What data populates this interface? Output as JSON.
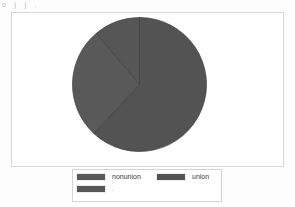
{
  "page": {
    "scan_header_text": "o  j  j  .",
    "background_color": "#fdfdfd"
  },
  "chart_frame": {
    "border_color": "#d8d8da",
    "background_color": "#ffffff"
  },
  "legend": {
    "border_color": "#d4d4d6",
    "background_color": "#ffffff",
    "items": [
      {
        "label": "nonunion",
        "color": "#595959"
      },
      {
        "label": "union",
        "color": "#535353"
      },
      {
        "label": ".",
        "color": "#565656"
      }
    ]
  },
  "chart_data": {
    "type": "pie",
    "title": "",
    "subtitle": "",
    "xlabel": "",
    "ylabel": "",
    "grid": false,
    "legend_position": "bottom",
    "categories": [
      "union",
      "nonunion",
      "."
    ],
    "values": [
      62,
      27,
      11
    ],
    "colors": [
      "#535353",
      "#595959",
      "#565656"
    ],
    "slices": [
      {
        "name": "union",
        "value": 62,
        "color": "#535353",
        "start_angle_deg": 0,
        "end_angle_deg": 223,
        "path": "M 68.5 68.5 L 68.5 1.5 A 67 67 0 1 1 22.8 120.2 Z"
      },
      {
        "name": "nonunion",
        "value": 27,
        "color": "#595959",
        "start_angle_deg": 223,
        "end_angle_deg": 320,
        "path": "M 68.5 68.5 L 22.8 120.2 A 67 67 0 0 1 25.6 25.1 Z"
      },
      {
        "name": ".",
        "value": 11,
        "color": "#565656",
        "start_angle_deg": 320,
        "end_angle_deg": 360,
        "path": "M 68.5 68.5 L 25.6 25.1 A 67 67 0 0 1 68.5 1.5 Z"
      }
    ],
    "divider_color": "#3f3f3f",
    "center": [
      68.5,
      68.5
    ],
    "radius": 67
  }
}
